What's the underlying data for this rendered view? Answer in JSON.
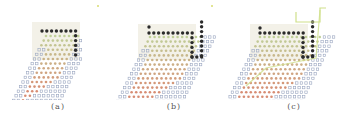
{
  "figure": {
    "panels": [
      {
        "id": "a",
        "caption": "(a)",
        "offset_x": 0
      },
      {
        "id": "b",
        "caption": "(b)",
        "offset_x": 112
      },
      {
        "id": "c",
        "caption": "(c)",
        "offset_x": 226
      }
    ],
    "colors": {
      "background": "#ffffff",
      "shade": "#f3f1e8",
      "path_dot": "#2a2a2a",
      "empty_dot": "#9aa6c0",
      "warm_dot": "#d0785a",
      "mid_dot": "#c9a070",
      "cool_dot": "#b6c98a",
      "green_line": "#cfe08a",
      "marker": "#d8dc70",
      "caption": "#555555"
    },
    "legend": []
  }
}
